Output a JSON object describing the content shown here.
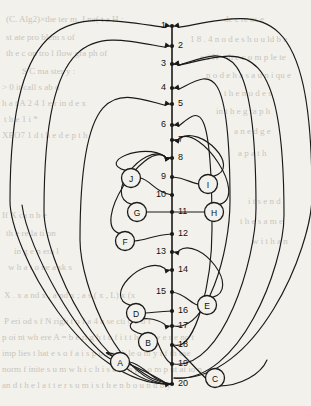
{
  "figure": {
    "width": 311,
    "height": 406,
    "background_color": "#f3f1ec",
    "ink_color": "#1a1a1a",
    "bleed_text_color": "#c9c5bb"
  },
  "spine": {
    "x": 172,
    "top_y": 26,
    "bottom_y": 384
  },
  "numbered_nodes": [
    {
      "label": "1",
      "x": 172,
      "y": 26,
      "label_side": "left"
    },
    {
      "label": "2",
      "x": 172,
      "y": 46,
      "label_side": "right"
    },
    {
      "label": "3",
      "x": 172,
      "y": 64,
      "label_side": "left"
    },
    {
      "label": "4",
      "x": 172,
      "y": 88,
      "label_side": "left"
    },
    {
      "label": "5",
      "x": 172,
      "y": 104,
      "label_side": "right"
    },
    {
      "label": "6",
      "x": 172,
      "y": 125,
      "label_side": "left"
    },
    {
      "label": "7",
      "x": 172,
      "y": 140,
      "label_side": "right"
    },
    {
      "label": "8",
      "x": 172,
      "y": 158,
      "label_side": "right"
    },
    {
      "label": "9",
      "x": 172,
      "y": 177,
      "label_side": "left"
    },
    {
      "label": "10",
      "x": 172,
      "y": 195,
      "label_side": "left"
    },
    {
      "label": "11",
      "x": 172,
      "y": 212,
      "label_side": "right"
    },
    {
      "label": "12",
      "x": 172,
      "y": 234,
      "label_side": "right"
    },
    {
      "label": "13",
      "x": 172,
      "y": 252,
      "label_side": "left"
    },
    {
      "label": "14",
      "x": 172,
      "y": 270,
      "label_side": "right"
    },
    {
      "label": "15",
      "x": 172,
      "y": 292,
      "label_side": "left"
    },
    {
      "label": "16",
      "x": 172,
      "y": 311,
      "label_side": "right"
    },
    {
      "label": "17",
      "x": 172,
      "y": 326,
      "label_side": "right"
    },
    {
      "label": "18",
      "x": 172,
      "y": 345,
      "label_side": "right"
    },
    {
      "label": "19",
      "x": 172,
      "y": 364,
      "label_side": "right"
    },
    {
      "label": "20",
      "x": 172,
      "y": 384,
      "label_side": "right"
    }
  ],
  "letter_nodes": [
    {
      "label": "A",
      "x": 120,
      "y": 362,
      "r": 9.5
    },
    {
      "label": "B",
      "x": 148,
      "y": 342,
      "r": 9.5
    },
    {
      "label": "C",
      "x": 215,
      "y": 378,
      "r": 9.5
    },
    {
      "label": "D",
      "x": 136,
      "y": 313,
      "r": 9.5
    },
    {
      "label": "E",
      "x": 207,
      "y": 305,
      "r": 9.5
    },
    {
      "label": "F",
      "x": 125,
      "y": 241,
      "r": 9.5
    },
    {
      "label": "G",
      "x": 137,
      "y": 212,
      "r": 9.5
    },
    {
      "label": "H",
      "x": 214,
      "y": 212,
      "r": 9.5
    },
    {
      "label": "I",
      "x": 208,
      "y": 184,
      "r": 9.5
    },
    {
      "label": "J",
      "x": 131,
      "y": 178,
      "r": 9.5
    }
  ],
  "edges": [
    {
      "from": "A",
      "to": "20",
      "side": "left",
      "kind": "entry"
    },
    {
      "from": "B",
      "to": "17",
      "side": "left",
      "kind": "back"
    },
    {
      "from": "B",
      "to": "19",
      "side": "right",
      "kind": "forward"
    },
    {
      "from": "C",
      "to": "18",
      "side": "right",
      "kind": "entry"
    },
    {
      "from": "C",
      "to": "3",
      "side": "right",
      "kind": "back-long"
    },
    {
      "from": "C",
      "to": "1",
      "side": "right",
      "kind": "back-long"
    },
    {
      "from": "D",
      "to": "14",
      "side": "left",
      "kind": "back"
    },
    {
      "from": "D",
      "to": "16",
      "side": "right",
      "kind": "entry"
    },
    {
      "from": "E",
      "to": "13",
      "side": "right",
      "kind": "back"
    },
    {
      "from": "E",
      "to": "15",
      "side": "left",
      "kind": "entry"
    },
    {
      "from": "F",
      "to": "8",
      "side": "left",
      "kind": "back"
    },
    {
      "from": "F",
      "to": "12",
      "side": "right",
      "kind": "entry"
    },
    {
      "from": "G",
      "to": "8",
      "side": "left",
      "kind": "back"
    },
    {
      "from": "G",
      "to": "11",
      "side": "right",
      "kind": "entry"
    },
    {
      "from": "H",
      "to": "7",
      "side": "right",
      "kind": "back"
    },
    {
      "from": "H",
      "to": "11",
      "side": "left",
      "kind": "entry"
    },
    {
      "from": "I",
      "to": "9",
      "side": "left",
      "kind": "entry"
    },
    {
      "from": "I",
      "to": "7",
      "side": "right",
      "kind": "back"
    },
    {
      "from": "J",
      "to": "8",
      "side": "right",
      "kind": "back"
    },
    {
      "from": "J",
      "to": "10",
      "side": "right",
      "kind": "entry"
    },
    {
      "from": "20",
      "to": "5",
      "side": "left",
      "kind": "back-long"
    },
    {
      "from": "20",
      "to": "2",
      "side": "left",
      "kind": "back-long"
    },
    {
      "from": "20",
      "to": "1",
      "side": "left",
      "kind": "back-long"
    },
    {
      "from": "19",
      "to": "3",
      "side": "right",
      "kind": "back-long"
    },
    {
      "from": "18",
      "to": "6",
      "side": "right",
      "kind": "back-long"
    },
    {
      "from": "17",
      "to": "4",
      "side": "right",
      "kind": "back-long"
    }
  ],
  "bleed_text": [
    {
      "text": "(C.  Alg2)×the ter m.    J ne( t a H :",
      "x": 6,
      "y": 14
    },
    {
      "text": "st ate pro blem s of",
      "x": 6,
      "y": 32
    },
    {
      "text": "th e c on tro l flow gra ph of",
      "x": 6,
      "y": 48
    },
    {
      "text": "S   C ma ster y :",
      "x": 22,
      "y": 66
    },
    {
      "text": "> 0    it call s ab d",
      "x": 2,
      "y": 82
    },
    {
      "text": "h a t A 2 4 1 e r   in d e  x",
      "x": 2,
      "y": 98
    },
    {
      "text": "t h e 1 i *",
      "x": 4,
      "y": 114
    },
    {
      "text": "XEO7 1 d   t h e  d e p t  h",
      "x": 2,
      "y": 130
    },
    {
      "text": "de c re as e",
      "x": 224,
      "y": 14
    },
    {
      "text": "1 8 . 4 n o d e s h o u ld  b e",
      "x": 190,
      "y": 34
    },
    {
      "text": "o f N  - th  e  c  o m p le te",
      "x": 200,
      "y": 52
    },
    {
      "text": "n o d e  h a s  a   u n i qu e",
      "x": 206,
      "y": 70
    },
    {
      "text": "t h e  n o d e s",
      "x": 224,
      "y": 88
    },
    {
      "text": "in   t h e  g ra p h",
      "x": 216,
      "y": 106
    },
    {
      "text": "a n  e d g e",
      "x": 234,
      "y": 126
    },
    {
      "text": "a   p a t h",
      "x": 238,
      "y": 148
    },
    {
      "text": "If  X  ca n b e",
      "x": 2,
      "y": 210
    },
    {
      "text": "th e  re  la ti on",
      "x": 6,
      "y": 228
    },
    {
      "text": "in  g e n era l",
      "x": 14,
      "y": 246
    },
    {
      "text": "w h a t  o ne  a sk s",
      "x": 8,
      "y": 262
    },
    {
      "text": "i t s   e  n d",
      "x": 248,
      "y": 196
    },
    {
      "text": "t h e  s a m e",
      "x": 240,
      "y": 216
    },
    {
      "text": "w i t h  a n",
      "x": 252,
      "y": 236
    },
    {
      "text": "X .  x   a nd x ,  a nd x ; a   s ( x ,  L) x (x",
      "x": 4,
      "y": 290
    },
    {
      "text": "P eri od s   f  N  righ t o f   a   4      a  se  cti o n  o f",
      "x": 4,
      "y": 316
    },
    {
      "text": "p oi  nt  wh ere  A  =   b  e  ri  g h t   o f    i  t   t h e y   w e r e  no t",
      "x": 2,
      "y": 332
    },
    {
      "text": "imp lies  t hat  e  s  o f    a  i  s     p o s s i b le  o nl y   i  f    th ese",
      "x": 2,
      "y": 348
    },
    {
      "text": "norm  f inite  s  u  m   w  h  i  c h    i s   a   lo  n g  c o m p ut at io n",
      "x": 2,
      "y": 364
    },
    {
      "text": "an  d  t h  e  l a t t e r  s  u  m   i s   t h e n   b o u n d   b y",
      "x": 2,
      "y": 380
    }
  ]
}
